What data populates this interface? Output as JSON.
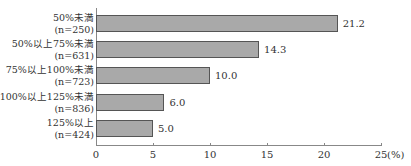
{
  "chart_data": {
    "type": "bar",
    "orientation": "horizontal",
    "title": "",
    "xlabel": "(%)",
    "ylabel": "",
    "xlim": [
      0,
      25
    ],
    "grid": false,
    "categories": [
      {
        "label": "50%未満",
        "n": "(n=250)"
      },
      {
        "label": "50%以上75%未満",
        "n": "(n=631)"
      },
      {
        "label": "75%以上100%未満",
        "n": "(n=723)"
      },
      {
        "label": "100%以上125%未満",
        "n": "(n=836)"
      },
      {
        "label": "125%以上",
        "n": "(n=424)"
      }
    ],
    "values": [
      21.2,
      14.3,
      10.0,
      6.0,
      5.0
    ],
    "value_labels": [
      "21.2",
      "14.3",
      "10.0",
      "6.0",
      "5.0"
    ],
    "ticks": [
      "0",
      "5",
      "10",
      "15",
      "20",
      "25"
    ],
    "unit_label": "(%)",
    "bar_color": "#a9a9a9"
  }
}
